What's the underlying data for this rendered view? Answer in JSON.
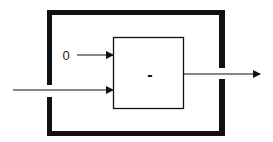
{
  "diagram": {
    "type": "block-diagram",
    "inner_block": {
      "label": "-"
    },
    "constant_input": {
      "label": "0"
    },
    "inputs": [
      "0",
      "signal"
    ],
    "output": "signal",
    "colors": {
      "stroke": "#111111",
      "background": "#ffffff"
    }
  }
}
